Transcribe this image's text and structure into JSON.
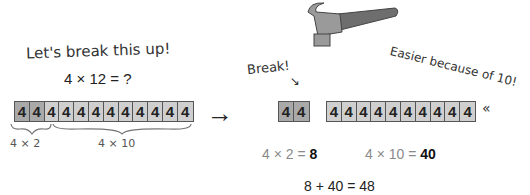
{
  "left": {
    "heading": "Let's break this up!",
    "problem": "4 × 12 = ?",
    "cells": [
      "4",
      "4",
      "4",
      "4",
      "4",
      "4",
      "4",
      "4",
      "4",
      "4",
      "4",
      "4"
    ],
    "brace_labels": {
      "small": "4 × 2",
      "large": "4 × 10"
    }
  },
  "arrow": "→",
  "right": {
    "break_label": "Break!",
    "easier_label": "Easier because of 10!",
    "group_small": [
      "4",
      "4"
    ],
    "group_large": [
      "4",
      "4",
      "4",
      "4",
      "4",
      "4",
      "4",
      "4",
      "4",
      "4"
    ],
    "eq_small": {
      "expr": "4 × 2 = ",
      "result": "8"
    },
    "eq_large": {
      "expr": "4 × 10 = ",
      "result": "40"
    },
    "total": "8 + 40 = 48"
  },
  "colors": {
    "cell_light": "#cfcfcf",
    "cell_dark": "#a9a9a9",
    "hammer_head": "#9a9a9a",
    "hammer_handle": "#6e6e6e"
  }
}
